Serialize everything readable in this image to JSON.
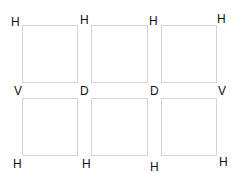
{
  "diagram": {
    "boxes": [
      {
        "row": 1,
        "col": 1
      },
      {
        "row": 1,
        "col": 2
      },
      {
        "row": 1,
        "col": 3
      },
      {
        "row": 2,
        "col": 1
      },
      {
        "row": 2,
        "col": 2
      },
      {
        "row": 2,
        "col": 3
      }
    ],
    "labels": {
      "top": [
        "H",
        "H",
        "H",
        "H"
      ],
      "middle": [
        "V",
        "D",
        "D",
        "V"
      ],
      "bottom": [
        "H",
        "H",
        "H",
        "H"
      ]
    },
    "border_color": "#d4d4d4"
  }
}
